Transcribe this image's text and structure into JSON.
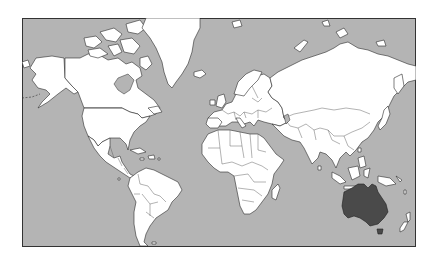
{
  "map": {
    "projection": "Mercator",
    "title": "",
    "colors": {
      "ocean": "#b4b4b4",
      "land": "#ffffff",
      "highlight": "#4a4a4a",
      "border": "#2a2a2a",
      "frame": "#333333",
      "background": "#ffffff"
    },
    "highlighted_region": {
      "name": "Australia",
      "fill": "#4a4a4a"
    },
    "continents": [
      "North America",
      "Greenland",
      "South America",
      "Europe",
      "Africa",
      "Asia",
      "Australia",
      "New Zealand"
    ]
  }
}
